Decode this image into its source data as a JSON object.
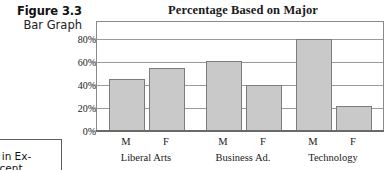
{
  "figure": {
    "number": "Figure 3.3",
    "kind": "Bar Graph"
  },
  "side_note": {
    "line1": "le in Ex-",
    "line2": "ercent."
  },
  "colors": {
    "bar_fill": "#c9c9c9",
    "bar_border": "#7c7c7c",
    "gridline": "#9a9a9a",
    "frame": "#8a8a8a",
    "text": "#1a1a1a"
  },
  "chart_data": {
    "type": "bar",
    "title": "Percentage Based on Major",
    "xlabel": "",
    "ylabel": "",
    "ylim": [
      0,
      90
    ],
    "grid": true,
    "legend": "none",
    "categories": [
      "M",
      "F",
      "M",
      "F",
      "M",
      "F"
    ],
    "values": [
      45,
      55,
      61,
      40,
      80,
      22
    ],
    "groups": [
      {
        "label": "Liberal Arts",
        "bars": [
          {
            "category": "M",
            "value": 45
          },
          {
            "category": "F",
            "value": 55
          }
        ]
      },
      {
        "label": "Business Ad.",
        "bars": [
          {
            "category": "M",
            "value": 61
          },
          {
            "category": "F",
            "value": 40
          }
        ]
      },
      {
        "label": "Technology",
        "bars": [
          {
            "category": "M",
            "value": 80
          },
          {
            "category": "F",
            "value": 22
          }
        ]
      }
    ],
    "ytick_labels": [
      "80%",
      "60%",
      "40%",
      "20%",
      "0%"
    ],
    "ytick_values": [
      80,
      60,
      40,
      20,
      0
    ]
  }
}
